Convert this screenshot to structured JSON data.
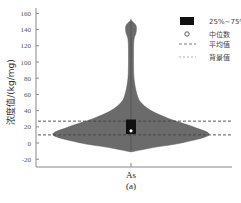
{
  "chart_data": {
    "type": "violin",
    "title": "",
    "subtitle": "(a)",
    "xlabel": "",
    "ylabel": "浓度值/(kg/mg)",
    "categories": [
      "As"
    ],
    "ylim": [
      -30,
      165
    ],
    "yticks": [
      -20,
      0,
      20,
      40,
      60,
      80,
      100,
      120,
      140,
      160
    ],
    "grid": false,
    "legend_position": "upper right",
    "legend": [
      {
        "symbol": "box",
        "label": "25%~75%"
      },
      {
        "symbol": "circle",
        "label": "中位数"
      },
      {
        "symbol": "dashed-line",
        "label": "平均值"
      },
      {
        "symbol": "dashed-line-light",
        "label": "背景值"
      }
    ],
    "series": [
      {
        "name": "As",
        "q1": 11,
        "q3": 29,
        "median": 15,
        "mean": 27,
        "background": 10,
        "min": -11,
        "max": 152,
        "density_profile": [
          {
            "y": -11,
            "half_width": 0
          },
          {
            "y": -5,
            "half_width": 25
          },
          {
            "y": 0,
            "half_width": 50
          },
          {
            "y": 10,
            "half_width": 78
          },
          {
            "y": 20,
            "half_width": 62
          },
          {
            "y": 30,
            "half_width": 38
          },
          {
            "y": 40,
            "half_width": 20
          },
          {
            "y": 50,
            "half_width": 10
          },
          {
            "y": 60,
            "half_width": 6
          },
          {
            "y": 80,
            "half_width": 3
          },
          {
            "y": 110,
            "half_width": 2.5
          },
          {
            "y": 128,
            "half_width": 3
          },
          {
            "y": 136,
            "half_width": 5
          },
          {
            "y": 145,
            "half_width": 5
          },
          {
            "y": 152,
            "half_width": 0
          }
        ]
      }
    ],
    "reference_lines": [
      {
        "name": "平均值",
        "value": 27,
        "style": "dashed",
        "color": "#555555"
      },
      {
        "name": "背景值",
        "value": 10,
        "style": "dashed",
        "color": "#555555"
      }
    ],
    "colors": {
      "violin": "#6b6b6b",
      "box": "#111111",
      "median": "#ffffff",
      "axis": "#777777"
    }
  }
}
